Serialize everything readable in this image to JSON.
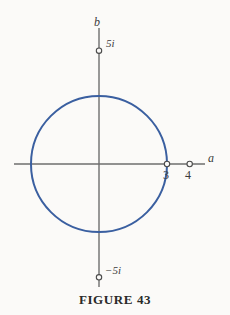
{
  "figure": {
    "caption": "FIGURE 43",
    "background_color": "#fbfaf8"
  },
  "axes": {
    "horizontal": {
      "name": "a",
      "color": "#6e6e6e"
    },
    "vertical": {
      "name": "b",
      "color": "#6e6e6e"
    }
  },
  "labels": {
    "imaginary_positive": "5i",
    "imaginary_negative": "−5i",
    "real_tick_3": "3",
    "real_tick_4": "4"
  },
  "chart_data": {
    "type": "scatter",
    "title": "FIGURE 43",
    "subtitle": "",
    "xlabel": "a",
    "ylabel": "b",
    "xlim": [
      -5.9,
      7.6
    ],
    "ylim": [
      -9.0,
      9.5
    ],
    "grid": false,
    "legend": null,
    "xticks": [
      3,
      4
    ],
    "xticklabels": [
      "3",
      "4"
    ],
    "yticks": [
      5,
      -5
    ],
    "yticklabels": [
      "5i",
      "−5i"
    ],
    "annotations": [
      {
        "text": "b",
        "x": 0,
        "y": 9.5,
        "style": "italic"
      },
      {
        "text": "a",
        "x": 7.6,
        "y": 0,
        "style": "italic"
      },
      {
        "text": "5i",
        "x": 0.6,
        "y": 5,
        "style": "italic"
      },
      {
        "text": "−5i",
        "x": 0.6,
        "y": -5,
        "style": "italic"
      },
      {
        "text": "3",
        "x": 3,
        "y": -0.85,
        "style": "normal"
      },
      {
        "text": "4",
        "x": 4,
        "y": -0.85,
        "style": "normal"
      }
    ],
    "series": [
      {
        "name": "circle |z| = 3",
        "type": "circle",
        "center": [
          0,
          0
        ],
        "radius": 3,
        "color": "#3a5fa0",
        "linewidth": 2,
        "filled": false
      },
      {
        "name": "marked points",
        "type": "scatter",
        "marker": "open-circle",
        "color": "#4a4a4a",
        "points": [
          {
            "x": 0,
            "y": 5,
            "label": "5i"
          },
          {
            "x": 0,
            "y": -5,
            "label": "−5i"
          },
          {
            "x": 3,
            "y": 0,
            "label": "3"
          },
          {
            "x": 4,
            "y": 0,
            "label": "4"
          }
        ]
      }
    ]
  },
  "colors": {
    "circle_stroke": "#3a5fa0",
    "axis": "#6e6e6e",
    "marker_stroke": "#4a4a4a",
    "text": "#3b3b3b",
    "caption_text": "#2a2a2a"
  }
}
